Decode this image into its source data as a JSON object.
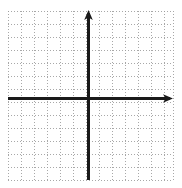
{
  "figure": {
    "title": "",
    "type": "coordinate-plane",
    "width": 182,
    "height": 188,
    "background_color": "#ffffff"
  },
  "chart_data": {
    "type": "scatter",
    "title": "",
    "subtitle": "",
    "xlabel": "",
    "ylabel": "",
    "series": [],
    "categories": [],
    "values": [],
    "annotations": [],
    "legend": {
      "visible": false,
      "position": "none",
      "entries": []
    },
    "grid": {
      "visible": true,
      "style": "dotted",
      "color": "#9a9a9a",
      "cell_size_px": 13.0,
      "columns": 13,
      "rows": 13,
      "x_min_px": 8,
      "x_max_px": 173,
      "y_min_px": 11,
      "y_max_px": 180
    },
    "axes": {
      "x_axis": {
        "label": "",
        "position_px": 98,
        "start_px": 8,
        "end_px": 173,
        "color": "#1a1a1a",
        "thickness_px": 2.4,
        "arrow_start": false,
        "arrow_end": true,
        "tick_labels": [],
        "xlim": [
          -6.2,
          6.5
        ]
      },
      "y_axis": {
        "label": "",
        "position_px": 88,
        "start_px": 11,
        "end_px": 180,
        "color": "#1a1a1a",
        "thickness_px": 2.4,
        "arrow_start": true,
        "arrow_end": false,
        "tick_labels": [],
        "ylim": [
          -6.3,
          6.7
        ]
      },
      "origin_px": {
        "x": 88,
        "y": 98
      }
    },
    "data_points": []
  },
  "colors": {
    "grid_dot": "#9a9a9a",
    "axis": "#1a1a1a",
    "background": "#ffffff"
  }
}
